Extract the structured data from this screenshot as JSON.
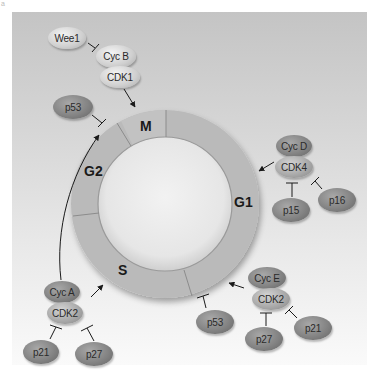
{
  "figure": {
    "panel_letter": "a"
  },
  "colors": {
    "background_top": "#c4c4c4",
    "background_bottom": "#fafafa",
    "ring": "#b9b9b9",
    "ring_inner": "#ececec",
    "divider": "#8a8a8a",
    "text": "#1a1a1a"
  },
  "phases": [
    {
      "id": "M",
      "label": "M"
    },
    {
      "id": "G1",
      "label": "G1"
    },
    {
      "id": "S",
      "label": "S"
    },
    {
      "id": "G2",
      "label": "G2"
    }
  ],
  "proteins": {
    "wee1": "Wee1",
    "cyc_b": "Cyc B",
    "cdk1": "CDK1",
    "p53_g2": "p53",
    "cyc_d": "Cyc D",
    "cdk4": "CDK4",
    "p15": "p15",
    "p16": "p16",
    "cyc_e": "Cyc E",
    "cdk2_g1s": "CDK2",
    "p53_g1s": "p53",
    "p27_g1s": "p27",
    "p21_g1s": "p21",
    "cyc_a": "Cyc A",
    "cdk2_s": "CDK2",
    "p21_s": "p21",
    "p27_s": "p27"
  },
  "interactions": [
    {
      "from": "Wee1",
      "to": "Cyc B/CDK1",
      "type": "inhibit"
    },
    {
      "from": "Cyc B/CDK1",
      "to": "M",
      "type": "activate"
    },
    {
      "from": "p53",
      "to": "G2/M",
      "type": "inhibit"
    },
    {
      "from": "Cyc A/CDK2",
      "to": "G2/M",
      "type": "activate"
    },
    {
      "from": "Cyc A/CDK2",
      "to": "S",
      "type": "activate"
    },
    {
      "from": "p21",
      "to": "Cyc A/CDK2",
      "type": "inhibit"
    },
    {
      "from": "p27",
      "to": "Cyc A/CDK2",
      "type": "inhibit"
    },
    {
      "from": "Cyc D/CDK4",
      "to": "G1",
      "type": "activate"
    },
    {
      "from": "p15",
      "to": "Cyc D/CDK4",
      "type": "inhibit"
    },
    {
      "from": "p16",
      "to": "Cyc D/CDK4",
      "type": "inhibit"
    },
    {
      "from": "Cyc E/CDK2",
      "to": "G1/S",
      "type": "activate"
    },
    {
      "from": "p27",
      "to": "Cyc E/CDK2",
      "type": "inhibit"
    },
    {
      "from": "p21",
      "to": "Cyc E/CDK2",
      "type": "inhibit"
    },
    {
      "from": "p53",
      "to": "G1/S",
      "type": "inhibit"
    }
  ]
}
